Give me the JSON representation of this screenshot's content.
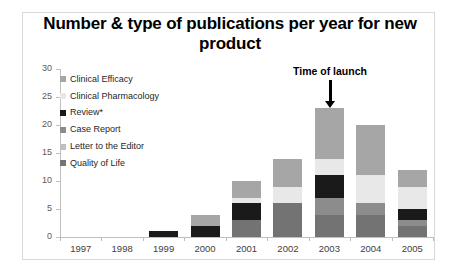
{
  "chart_data": {
    "type": "bar",
    "subtype": "stacked-column",
    "title": "Number & type of publications per year for new product",
    "xlabel": "",
    "ylabel": "",
    "categories": [
      "1997",
      "1998",
      "1999",
      "2000",
      "2001",
      "2002",
      "2003",
      "2004",
      "2005"
    ],
    "ylim": [
      0,
      30
    ],
    "yticks": [
      0,
      5,
      10,
      15,
      20,
      25,
      30
    ],
    "grid": false,
    "legend_position": "inside-top-left",
    "series": [
      {
        "name": "Clinical Efficacy",
        "color": "#a6a6a6",
        "values": [
          0,
          0,
          0,
          2,
          3,
          5,
          9,
          9,
          3
        ]
      },
      {
        "name": "Clinical Pharmacology",
        "color": "#e8e8e8",
        "values": [
          0,
          0,
          0,
          0,
          1,
          3,
          3,
          5,
          4
        ]
      },
      {
        "name": "Review*",
        "color": "#1a1a1a",
        "values": [
          0,
          0,
          1,
          2,
          3,
          0,
          4,
          0,
          2
        ]
      },
      {
        "name": "Case Report",
        "color": "#8c8c8c",
        "values": [
          0,
          0,
          0,
          0,
          0,
          0,
          3,
          2,
          1
        ]
      },
      {
        "name": "Letter to the Editor",
        "color": "#bfbfbf",
        "values": [
          0,
          0,
          0,
          0,
          0,
          0,
          0,
          0,
          0
        ]
      },
      {
        "name": "Quality of Life",
        "color": "#737373",
        "values": [
          0,
          0,
          0,
          0,
          3,
          6,
          4,
          4,
          2
        ]
      }
    ],
    "totals": [
      0,
      0,
      1,
      4,
      10,
      14,
      23,
      20,
      12
    ],
    "annotations": [
      {
        "text": "Time of launch",
        "points_at_category": "2003",
        "style": "bold-text-with-down-arrow"
      }
    ]
  },
  "legend": {
    "items": [
      {
        "label": "Clinical Efficacy",
        "color": "#a6a6a6"
      },
      {
        "label": "Clinical Pharmacology",
        "color": "#e8e8e8"
      },
      {
        "label": "Review*",
        "color": "#1a1a1a"
      },
      {
        "label": "Case Report",
        "color": "#8c8c8c"
      },
      {
        "label": "Letter to the Editor",
        "color": "#bfbfbf"
      },
      {
        "label": "Quality of Life",
        "color": "#737373"
      }
    ]
  }
}
